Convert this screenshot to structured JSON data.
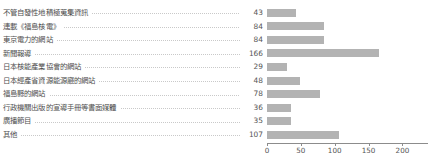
{
  "chart_data": {
    "type": "bar",
    "orientation": "horizontal",
    "title": "",
    "subtitle": "",
    "xlabel": "",
    "ylabel": "",
    "xlim": [
      0,
      220
    ],
    "xticks": [
      0,
      50,
      100,
      150,
      200
    ],
    "xtick_labels": [
      "0",
      "50",
      "100",
      "150",
      "200"
    ],
    "grid": false,
    "legend": false,
    "bar_color": "#b3b3b3",
    "axis_color": "#8c8c8c",
    "label_color": "#4f4f4f",
    "leader_color": "#c9c9c9",
    "categories": [
      "不管自發性地積極蒐集資訊",
      "連載《福島核電》",
      "東京電力的網站",
      "新聞報導",
      "日本核能產業協會的網站",
      "日本經產省資源能源廳的網站",
      "福島縣的網站",
      "行政機關出版的宣導手冊等書面媒體",
      "廣播節目",
      "其他"
    ],
    "values": [
      43,
      84,
      84,
      166,
      29,
      48,
      78,
      36,
      35,
      107
    ],
    "value_labels": [
      "43",
      "84",
      "84",
      "166",
      "29",
      "48",
      "78",
      "36",
      "35",
      "107"
    ]
  }
}
